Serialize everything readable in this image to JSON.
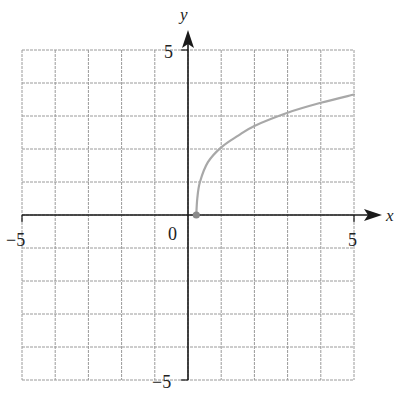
{
  "chart_data": {
    "type": "line",
    "title": "",
    "xlabel": "x",
    "ylabel": "y",
    "xlim": [
      -5,
      5
    ],
    "ylim": [
      -5,
      5
    ],
    "grid": true,
    "grid_step": 1,
    "tick_labels": {
      "x_min": "-5",
      "x_max": "5",
      "y_min": "-5",
      "y_max": "5",
      "origin": "0"
    },
    "series": [
      {
        "name": "curve",
        "color": "#a8a8a8",
        "start_point": {
          "x": 0.25,
          "y": 0,
          "marker": "filled-circle"
        },
        "points": [
          {
            "x": 0.25,
            "y": 0
          },
          {
            "x": 0.28,
            "y": 0.5
          },
          {
            "x": 0.36,
            "y": 1
          },
          {
            "x": 0.6,
            "y": 1.6
          },
          {
            "x": 1,
            "y": 2.05
          },
          {
            "x": 1.5,
            "y": 2.4
          },
          {
            "x": 2,
            "y": 2.7
          },
          {
            "x": 3,
            "y": 3.1
          },
          {
            "x": 4,
            "y": 3.4
          },
          {
            "x": 5,
            "y": 3.65
          }
        ]
      }
    ],
    "legend": null
  },
  "colors": {
    "axis": "#1a1a1a",
    "grid": "#9a9a9a",
    "curve": "#a8a8a8",
    "point": "#8a8a8a"
  }
}
